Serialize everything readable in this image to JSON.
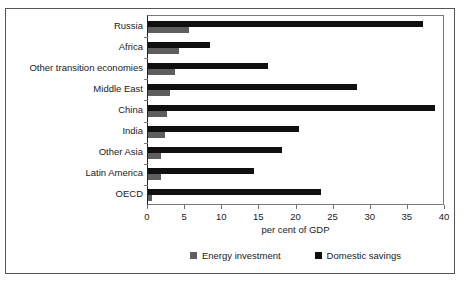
{
  "chart_data": {
    "type": "bar",
    "orientation": "horizontal",
    "title": "",
    "xlabel": "per cent of GDP",
    "ylabel": "",
    "xlim": [
      0,
      40
    ],
    "xticks": [
      "0",
      "5",
      "10",
      "15",
      "20",
      "25",
      "30",
      "35",
      "40"
    ],
    "grid": false,
    "legend_position": "bottom",
    "categories": [
      "Russia",
      "Africa",
      "Other transition economies",
      "Middle East",
      "China",
      "India",
      "Other Asia",
      "Latin America",
      "OECD"
    ],
    "series": [
      {
        "name": "Domestic savings",
        "color": "#101010",
        "values": [
          37.0,
          8.3,
          16.2,
          28.2,
          38.7,
          20.3,
          18.1,
          14.3,
          23.3
        ]
      },
      {
        "name": "Energy investment",
        "color": "#5e5e5e",
        "values": [
          5.5,
          4.2,
          3.7,
          3.0,
          2.5,
          2.3,
          1.8,
          1.7,
          0.6
        ]
      }
    ]
  },
  "legend": {
    "items": [
      {
        "label": "Energy investment",
        "color": "#5e5e5e"
      },
      {
        "label": "Domestic savings",
        "color": "#101010"
      }
    ]
  }
}
